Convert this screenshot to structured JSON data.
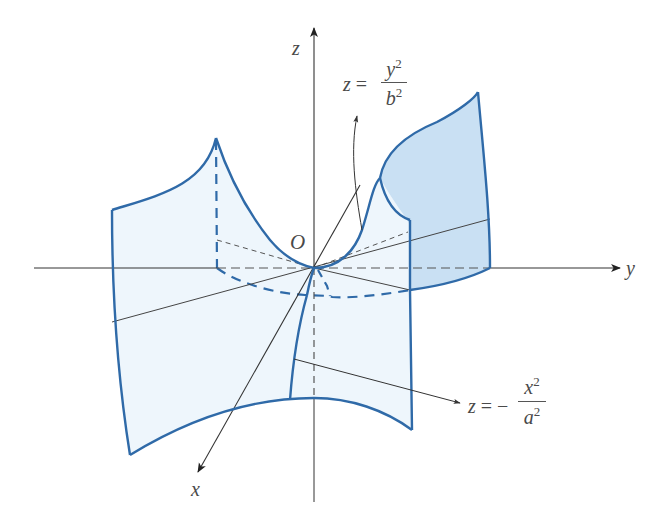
{
  "figure": {
    "axes": {
      "x_label": "x",
      "y_label": "y",
      "z_label": "z",
      "origin_label": "O"
    },
    "annotations": {
      "yz_trace": {
        "lhs": "z",
        "equals": "=",
        "numerator_var": "y",
        "numerator_exp": "2",
        "denominator_var": "b",
        "denominator_exp": "2"
      },
      "xz_trace": {
        "lhs": "z",
        "equals": "=",
        "sign": "−",
        "numerator_var": "x",
        "numerator_exp": "2",
        "denominator_var": "a",
        "denominator_exp": "2"
      }
    },
    "colors": {
      "surface_edge": "#2f6aa8",
      "surface_fill_light": "#eef6fc",
      "surface_fill_dark": "#c9e0f3",
      "axis": "#333333",
      "label": "#4a4a4a"
    }
  }
}
